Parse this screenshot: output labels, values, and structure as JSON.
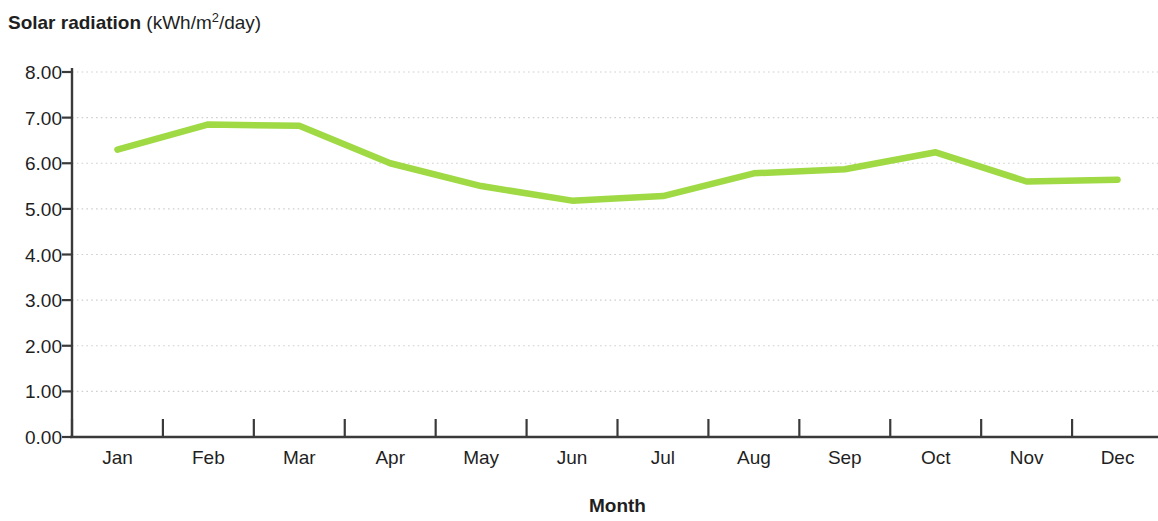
{
  "chart_data": {
    "type": "line",
    "title_bold_part": "Solar radiation",
    "title_units_part": " (kWh/m",
    "title_units_sup": "2",
    "title_units_tail": "/day)",
    "xlabel": "Month",
    "ylabel": "",
    "categories": [
      "Jan",
      "Feb",
      "Mar",
      "Apr",
      "May",
      "Jun",
      "Jul",
      "Aug",
      "Sep",
      "Oct",
      "Nov",
      "Dec"
    ],
    "values": [
      6.3,
      6.85,
      6.82,
      6.0,
      5.5,
      5.18,
      5.28,
      5.78,
      5.87,
      6.24,
      5.6,
      5.64
    ],
    "series": [
      {
        "name": "Solar radiation",
        "values": [
          6.3,
          6.85,
          6.82,
          6.0,
          5.5,
          5.18,
          5.28,
          5.78,
          5.87,
          6.24,
          5.6,
          5.64
        ],
        "color": "#9fd943"
      }
    ],
    "ylim": [
      0,
      8
    ],
    "ytick_step": 1,
    "ytick_labels": [
      "0.00",
      "1.00",
      "2.00",
      "3.00",
      "4.00",
      "5.00",
      "6.00",
      "7.00",
      "8.00"
    ],
    "grid": "horizontal-dotted",
    "grid_color": "#cfcfcf",
    "axis_color": "#3a3a3a",
    "legend": "none",
    "legend_position": "none",
    "background": "#ffffff"
  },
  "axes": {
    "y_tick_labels": [
      "8.00",
      "7.00",
      "6.00",
      "5.00",
      "4.00",
      "3.00",
      "2.00",
      "1.00",
      "0.00"
    ],
    "x_tick_labels": [
      "Jan",
      "Feb",
      "Mar",
      "Apr",
      "May",
      "Jun",
      "Jul",
      "Aug",
      "Sep",
      "Oct",
      "Nov",
      "Dec"
    ],
    "x_title": "Month"
  }
}
